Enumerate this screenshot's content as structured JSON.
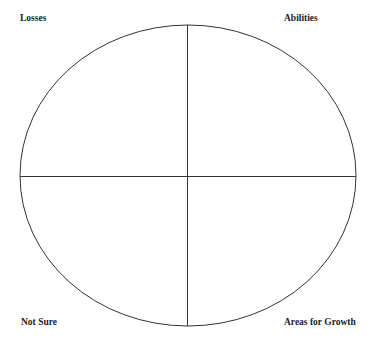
{
  "diagram": {
    "type": "quadrant-circle",
    "quadrants": {
      "top_left": "Losses",
      "top_right": "Abilities",
      "bottom_left": "Not Sure",
      "bottom_right": "Areas for Growth"
    },
    "stroke_color": "#333333",
    "background": "#ffffff"
  }
}
